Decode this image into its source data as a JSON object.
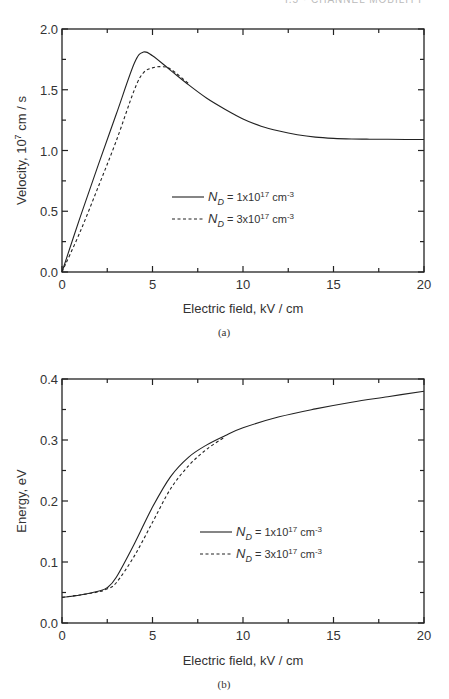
{
  "header": {
    "text": "I.5 · CHANNEL MOBILITY"
  },
  "chart_data": [
    {
      "type": "line",
      "panel": "(a)",
      "title": "",
      "xlabel": "Electric field, kV / cm",
      "ylabel": "Velocity, 10^7 cm / s",
      "ylabel_base": "Velocity, 10",
      "ylabel_exp": "7",
      "ylabel_unit": " cm / s",
      "xlim": [
        0,
        20
      ],
      "ylim": [
        0.0,
        2.0
      ],
      "xticks": [
        "0",
        "5",
        "10",
        "15",
        "20"
      ],
      "yticks": [
        "0.0",
        "0.5",
        "1.0",
        "1.5",
        "2.0"
      ],
      "grid": false,
      "legend_position": "center-right",
      "series": [
        {
          "name": "N_D = 1x10^17 cm^-3",
          "style": "solid",
          "x": [
            0,
            1,
            2,
            3,
            4,
            4.5,
            5,
            6,
            7,
            8,
            9,
            10,
            11,
            12,
            13,
            14,
            15,
            16,
            17,
            18,
            19,
            20
          ],
          "y": [
            0,
            0.45,
            0.88,
            1.3,
            1.72,
            1.81,
            1.78,
            1.66,
            1.54,
            1.43,
            1.34,
            1.26,
            1.2,
            1.16,
            1.13,
            1.11,
            1.1,
            1.095,
            1.093,
            1.092,
            1.091,
            1.09
          ]
        },
        {
          "name": "N_D = 3x10^17 cm^-3",
          "style": "dashed",
          "x": [
            0,
            1,
            2,
            3,
            4,
            4.5,
            5,
            5.5,
            6,
            7
          ],
          "y": [
            0,
            0.33,
            0.7,
            1.08,
            1.5,
            1.64,
            1.68,
            1.69,
            1.67,
            1.55
          ]
        }
      ],
      "legend": [
        {
          "label_n": "N",
          "label_sub": "D",
          "label_rest": " = 1x10",
          "label_exp1": "17",
          "label_unit": " cm",
          "label_exp2": "-3"
        },
        {
          "label_n": "N",
          "label_sub": "D",
          "label_rest": " = 3x10",
          "label_exp1": "17",
          "label_unit": " cm",
          "label_exp2": "-3"
        }
      ],
      "caption": "(a)"
    },
    {
      "type": "line",
      "panel": "(b)",
      "title": "",
      "xlabel": "Electric field, kV / cm",
      "ylabel": "Energy, eV",
      "xlim": [
        0,
        20
      ],
      "ylim": [
        0.0,
        0.4
      ],
      "xticks": [
        "0",
        "5",
        "10",
        "15",
        "20"
      ],
      "yticks": [
        "0.0",
        "0.1",
        "0.2",
        "0.3",
        "0.4"
      ],
      "grid": false,
      "legend_position": "lower-right",
      "series": [
        {
          "name": "N_D = 1x10^17 cm^-3",
          "style": "solid",
          "x": [
            0,
            1,
            2,
            2.5,
            3,
            4,
            5,
            6,
            7,
            8,
            9,
            10,
            12,
            14,
            16,
            18,
            20
          ],
          "y": [
            0.042,
            0.046,
            0.052,
            0.058,
            0.075,
            0.13,
            0.19,
            0.24,
            0.272,
            0.292,
            0.307,
            0.32,
            0.338,
            0.351,
            0.362,
            0.371,
            0.38
          ]
        },
        {
          "name": "N_D = 3x10^17 cm^-3",
          "style": "dashed",
          "x": [
            0,
            1,
            2,
            2.5,
            3,
            4,
            5,
            6,
            7,
            8,
            9
          ],
          "y": [
            0.042,
            0.046,
            0.051,
            0.056,
            0.066,
            0.11,
            0.165,
            0.22,
            0.258,
            0.285,
            0.305
          ]
        }
      ],
      "legend": [
        {
          "label_n": "N",
          "label_sub": "D",
          "label_rest": " = 1x10",
          "label_exp1": "17",
          "label_unit": " cm",
          "label_exp2": "-3"
        },
        {
          "label_n": "N",
          "label_sub": "D",
          "label_rest": " = 3x10",
          "label_exp1": "17",
          "label_unit": " cm",
          "label_exp2": "-3"
        }
      ],
      "caption": "(b)"
    }
  ]
}
